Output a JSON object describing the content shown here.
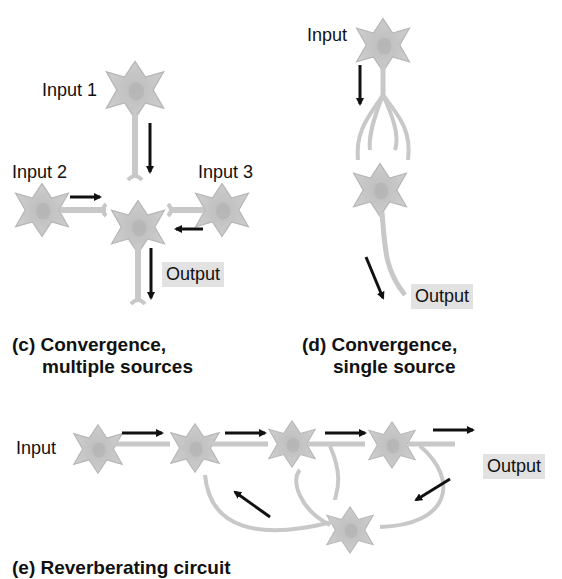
{
  "panel_c": {
    "labels": {
      "input1": "Input 1",
      "input2": "Input 2",
      "input3": "Input 3",
      "output": "Output"
    },
    "caption_line1": "(c) Convergence,",
    "caption_line2": "multiple sources"
  },
  "panel_d": {
    "labels": {
      "input": "Input",
      "output": "Output"
    },
    "caption_line1": "(d) Convergence,",
    "caption_line2": "single source"
  },
  "panel_e": {
    "labels": {
      "input": "Input",
      "output": "Output"
    },
    "caption": "(e) Reverberating circuit"
  },
  "colors": {
    "neuron": "#c8c8c8",
    "neuron_dark": "#a8a8a8",
    "arrow": "#111111",
    "output_bg": "#e2e2e2"
  }
}
